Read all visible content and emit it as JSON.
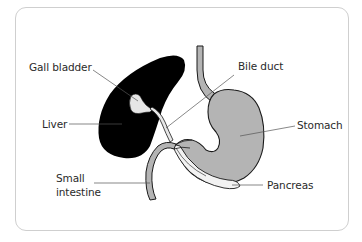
{
  "diagram": {
    "colors": {
      "liver": "#000000",
      "gall_bladder": "#e6e6e6",
      "stomach": "#b4b4b4",
      "small_intestine": "#b4b4b4",
      "pancreas": "#f2f2f2",
      "outline": "#1a1a1a",
      "leader_line": "#555555",
      "frame_border": "#cfcfcf"
    },
    "labels": {
      "gall_bladder": "Gall bladder",
      "liver": "Liver",
      "small_intestine_line1": "Small",
      "small_intestine_line2": "intestine",
      "bile_duct": "Bile duct",
      "stomach": "Stomach",
      "pancreas": "Pancreas"
    }
  }
}
